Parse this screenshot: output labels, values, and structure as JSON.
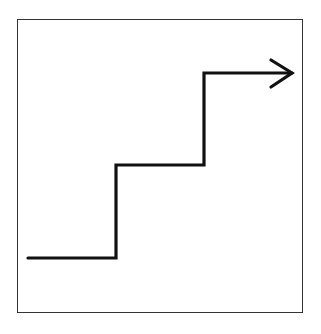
{
  "diagram": {
    "type": "step-up-arrow",
    "steps": 3,
    "stroke_color": "#111111",
    "frame_color": "#333333",
    "background": "#ffffff"
  }
}
